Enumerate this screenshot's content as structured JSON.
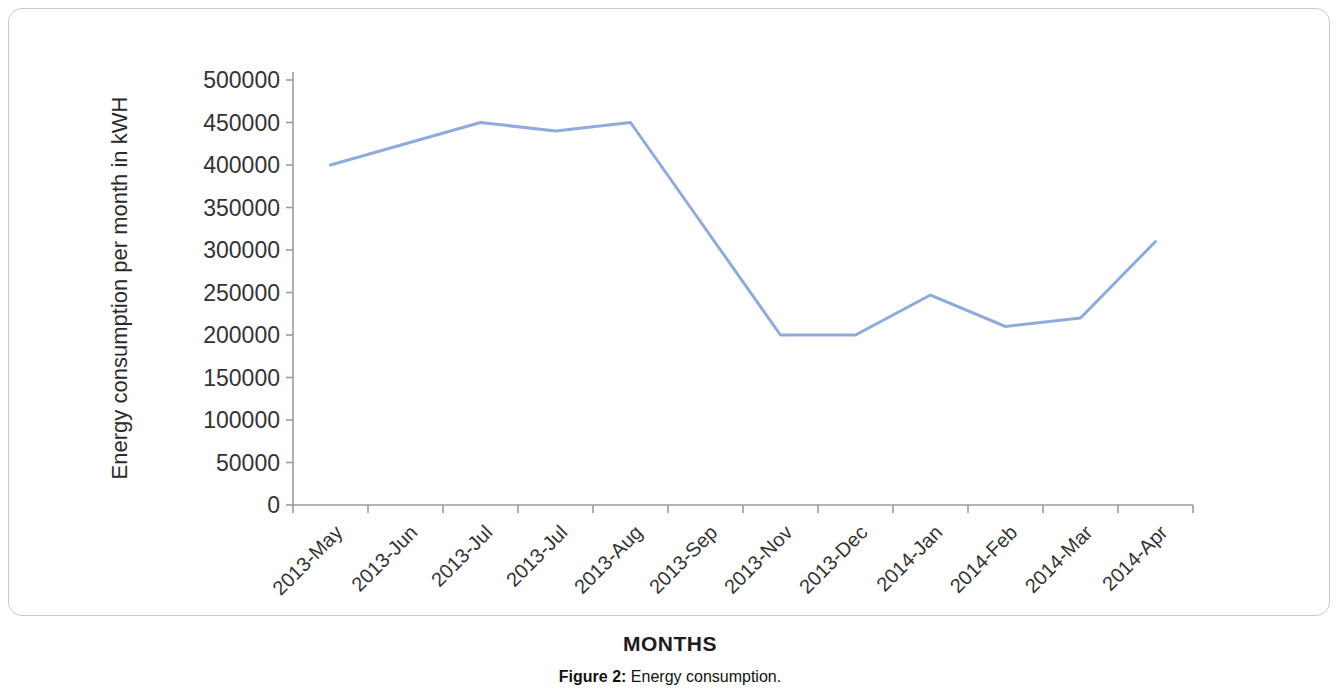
{
  "figure": {
    "caption_label": "Figure 2:",
    "caption_text": " Energy consumption."
  },
  "chart_data": {
    "type": "line",
    "title": "",
    "xlabel": "MONTHS",
    "ylabel": "Energy consumption per month in kWH",
    "categories": [
      "2013-May",
      "2013-Jun",
      "2013-Jul",
      "2013-Jul",
      "2013-Aug",
      "2013-Sep",
      "2013-Nov",
      "2013-Dec",
      "2014-Jan",
      "2014-Feb",
      "2014-Mar",
      "2014-Apr"
    ],
    "values": [
      400000,
      425000,
      450000,
      440000,
      450000,
      325000,
      200000,
      200000,
      247000,
      210000,
      220000,
      310000
    ],
    "ylim": [
      0,
      500000
    ],
    "ytick_values": [
      0,
      50000,
      100000,
      150000,
      200000,
      250000,
      300000,
      350000,
      400000,
      450000,
      500000
    ],
    "ytick_labels": [
      "0",
      "50000",
      "100000",
      "150000",
      "200000",
      "250000",
      "300000",
      "350000",
      "400000",
      "450000",
      "500000"
    ],
    "grid": false,
    "legend": false,
    "series": [
      {
        "name": "Energy consumption",
        "color": "#8FAADC",
        "line_width": 3,
        "values": [
          400000,
          425000,
          450000,
          440000,
          450000,
          325000,
          200000,
          200000,
          247000,
          210000,
          220000,
          310000
        ]
      }
    ],
    "colors": {
      "line": "#8FAADC",
      "axis": "#9b9b9b",
      "text": "#333333",
      "background": "#ffffff"
    }
  }
}
